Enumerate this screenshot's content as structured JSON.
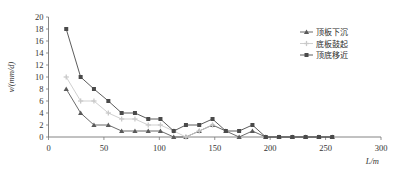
{
  "chart_data": {
    "type": "line",
    "title": "",
    "xlabel": "L/m",
    "ylabel": "v/(mm/d)",
    "xlim": [
      0,
      300
    ],
    "ylim": [
      0,
      20
    ],
    "xticks": [
      0,
      50,
      100,
      150,
      200,
      250,
      300
    ],
    "yticks": [
      0,
      2,
      4,
      6,
      8,
      10,
      12,
      14,
      16,
      18,
      20
    ],
    "grid": false,
    "legend_position": "upper-right",
    "series": [
      {
        "name": "顶板下沉",
        "marker": "triangle",
        "color": "#5a5a5a",
        "x": [
          16,
          29,
          41,
          54,
          66,
          78,
          90,
          101,
          113,
          124,
          136,
          148,
          160,
          172,
          184,
          196,
          208,
          220,
          232,
          244,
          256
        ],
        "y": [
          8,
          4,
          2,
          2,
          1,
          1,
          1,
          1,
          0,
          0,
          1,
          2,
          1,
          0,
          1,
          0,
          0,
          0,
          0,
          0,
          0
        ]
      },
      {
        "name": "底板鼓起",
        "marker": "plus",
        "color": "#c9c9c9",
        "x": [
          16,
          29,
          41,
          54,
          66,
          78,
          90,
          101,
          113,
          124,
          136,
          148
        ],
        "y": [
          10,
          6,
          6,
          4,
          3,
          3,
          2,
          2,
          1,
          0,
          1,
          2
        ]
      },
      {
        "name": "顶底移近",
        "marker": "square",
        "color": "#4a4a4a",
        "x": [
          16,
          29,
          41,
          54,
          66,
          78,
          90,
          101,
          113,
          124,
          136,
          148,
          160,
          172,
          184,
          196,
          208,
          220,
          232,
          244,
          256
        ],
        "y": [
          18,
          10,
          8,
          6,
          4,
          4,
          3,
          3,
          1,
          2,
          2,
          3,
          1,
          1,
          2,
          0,
          0,
          0,
          0,
          0,
          0
        ]
      }
    ]
  }
}
